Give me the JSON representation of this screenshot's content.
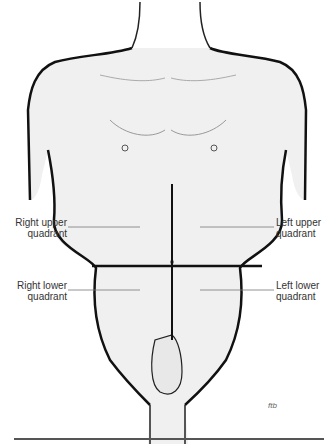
{
  "diagram": {
    "labels": {
      "right_upper": {
        "line1": "Right upper",
        "line2": "quadrant"
      },
      "left_upper": {
        "line1": "Left upper",
        "line2": "quadrant"
      },
      "right_lower": {
        "line1": "Right lower",
        "line2": "quadrant"
      },
      "left_lower": {
        "line1": "Left lower",
        "line2": "quadrant"
      }
    },
    "signature": "ftb"
  }
}
